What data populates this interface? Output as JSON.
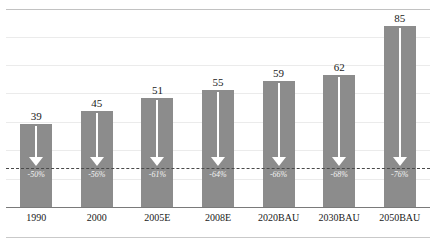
{
  "chart_data": {
    "type": "bar",
    "title": "",
    "subtitle": "",
    "xlabel": "",
    "ylabel": "",
    "categories": [
      "1990",
      "2000",
      "2005E",
      "2008E",
      "2020BAU",
      "2030BAU",
      "2050BAU"
    ],
    "values": [
      39,
      45,
      51,
      55,
      59,
      62,
      85
    ],
    "value_labels": [
      "39",
      "45",
      "51",
      "55",
      "59",
      "62",
      "85"
    ],
    "annotations": {
      "reduction_labels": [
        "-50%",
        "-56%",
        "-61%",
        "-64%",
        "-66%",
        "-68%",
        "-76%"
      ],
      "arrow_direction": "down",
      "arrow_target": "dashed reference line",
      "reference_line_value": 19.5
    },
    "ylim": [
      0,
      93
    ],
    "grid": true,
    "gridlines": [
      13,
      26,
      39,
      52,
      65,
      78,
      91
    ],
    "legend": null,
    "legend_position": "none",
    "colors": {
      "bar_fill": "#8c8c8c",
      "arrow": "#ffffff",
      "reference_line": "#4a4a4a",
      "gridline": "#ebebeb",
      "axis": "#7a7a7a",
      "value_text": "#1a1a1a",
      "pct_text": "#f2f2f2"
    }
  }
}
